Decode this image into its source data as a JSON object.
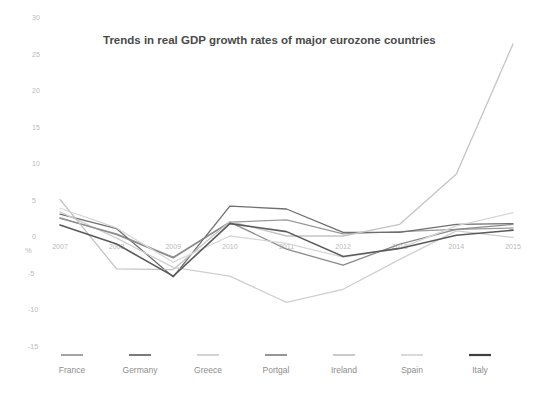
{
  "chart_data": {
    "type": "line",
    "title": "Trends in real GDP growth rates of major eurozone countries",
    "xlabel": "",
    "ylabel": "%",
    "ylim": [
      -15,
      30
    ],
    "xlim": [
      2007,
      2015
    ],
    "grid": false,
    "legend_position": "bottom",
    "yticks": [
      30,
      25,
      20,
      15,
      10,
      5,
      0,
      -5,
      -10,
      -15
    ],
    "ytick_labels": [
      "30",
      "25",
      "20",
      "15",
      "10",
      "5",
      "0",
      "-5",
      "-10",
      "-15"
    ],
    "categories": [
      2007,
      2008,
      2009,
      2010,
      2011,
      2012,
      2013,
      2014,
      2015
    ],
    "xtick_labels": [
      "2007",
      "2008",
      "2009",
      "2010",
      "2011",
      "2012",
      "2013",
      "2014",
      "2015"
    ],
    "series": [
      {
        "name": "France",
        "color": "#9a9a9a",
        "width": 1.3,
        "values": [
          2.4,
          0.3,
          -2.9,
          1.9,
          2.2,
          0.3,
          0.6,
          0.9,
          1.1
        ]
      },
      {
        "name": "Germany",
        "color": "#6e6e6e",
        "width": 1.3,
        "values": [
          3.0,
          1.0,
          -5.6,
          4.1,
          3.7,
          0.5,
          0.5,
          1.6,
          1.7
        ]
      },
      {
        "name": "Greece",
        "color": "#cfcfcf",
        "width": 1.3,
        "values": [
          3.3,
          -0.3,
          -4.3,
          -5.5,
          -9.1,
          -7.3,
          -3.2,
          0.7,
          -0.2
        ]
      },
      {
        "name": "Portgal",
        "color": "#8a8a8a",
        "width": 1.3,
        "values": [
          2.5,
          0.2,
          -3.0,
          1.9,
          -1.8,
          -4.0,
          -1.1,
          0.9,
          1.6
        ]
      },
      {
        "name": "Ireland",
        "color": "#c4c4c4",
        "width": 1.3,
        "values": [
          5.0,
          -4.5,
          -4.6,
          2.0,
          0.0,
          0.0,
          1.6,
          8.5,
          26.3
        ]
      },
      {
        "name": "Spain",
        "color": "#d6d6d6",
        "width": 1.3,
        "values": [
          3.8,
          1.1,
          -3.6,
          0.0,
          -1.0,
          -2.9,
          -1.7,
          1.4,
          3.2
        ]
      },
      {
        "name": "Italy",
        "color": "#5a5a5a",
        "width": 1.6,
        "values": [
          1.5,
          -1.1,
          -5.5,
          1.7,
          0.6,
          -2.8,
          -1.7,
          0.1,
          0.8
        ]
      }
    ]
  },
  "legend": {
    "items": [
      {
        "label": "France",
        "color": "#9a9a9a"
      },
      {
        "label": "Germany",
        "color": "#6e6e6e"
      },
      {
        "label": "Greece",
        "color": "#cfcfcf"
      },
      {
        "label": "Portgal",
        "color": "#8a8a8a"
      },
      {
        "label": "Ireland",
        "color": "#c4c4c4"
      },
      {
        "label": "Spain",
        "color": "#d6d6d6"
      },
      {
        "label": "Italy",
        "color": "#3f3f3f"
      }
    ]
  }
}
